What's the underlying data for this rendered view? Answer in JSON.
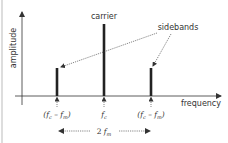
{
  "diagram": {
    "title": "",
    "axes": {
      "y_label": "amplitude",
      "x_label": "frequency"
    },
    "annotations": {
      "carrier_label": "carrier",
      "sidebands_label": "sidebands",
      "bandwidth_label_prefix": "2 ",
      "bandwidth_label_var": "f",
      "bandwidth_label_sub": "m"
    },
    "ticks": [
      {
        "id": "lower_sideband",
        "open": "(",
        "var1": "f",
        "sub1": "c",
        "op": " – ",
        "var2": "f",
        "sub2": "m",
        "close": ")"
      },
      {
        "id": "carrier",
        "var1": "f",
        "sub1": "c"
      },
      {
        "id": "upper_sideband",
        "open": "(",
        "var1": "f",
        "sub1": "c",
        "op": " – ",
        "var2": "f",
        "sub2": "m",
        "close": ")"
      }
    ],
    "lines": [
      {
        "name": "lower-sideband",
        "relative_amplitude": 0.43
      },
      {
        "name": "carrier",
        "relative_amplitude": 1.0
      },
      {
        "name": "upper-sideband",
        "relative_amplitude": 0.43
      }
    ],
    "colors": {
      "line": "#222222",
      "axis": "#333333",
      "text": "#333333",
      "border": "#bbbbbb"
    }
  }
}
